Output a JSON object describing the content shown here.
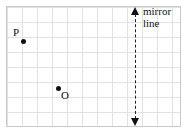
{
  "figure": {
    "type": "geometry-grid-diagram",
    "title": "",
    "grid": {
      "cell_size_px": 15,
      "columns": 11,
      "rows": 8,
      "border_color": "#c9c9c9",
      "line_color": "#e2e2e2"
    },
    "points": [
      {
        "id": "P",
        "label": "P",
        "dot_x": 21,
        "dot_y": 39,
        "label_x": 13,
        "label_y": 27
      },
      {
        "id": "O",
        "label": "O",
        "dot_x": 56,
        "dot_y": 86,
        "label_x": 61,
        "label_y": 90
      }
    ],
    "mirror_line": {
      "label_line_1": "mirror",
      "label_line_2": "line",
      "x_px": 135,
      "style": "dashed",
      "color": "#222222",
      "arrow_top": "arrow-up",
      "arrow_bottom": "arrow-down"
    }
  }
}
